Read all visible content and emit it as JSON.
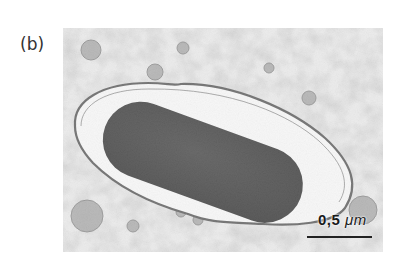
{
  "figure": {
    "panel_label": "(b)",
    "image_description": "Transmission electron micrograph: a dark rod-shaped bacterium enclosed within a membrane-bound vacuole (clear halo) surrounded by granular cytoplasm",
    "scale_bar": {
      "value": "0.5",
      "value_display": "0,5",
      "unit": "μm"
    },
    "colors": {
      "background": "#ffffff",
      "cytoplasm": "#c8c8c8",
      "vacuole": "#f4f4f4",
      "bacterium": "#2e2e2e",
      "membrane": "#555555"
    }
  }
}
